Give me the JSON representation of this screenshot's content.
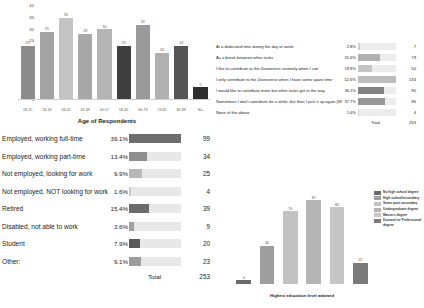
{
  "age_chart": {
    "xtitle": "Age of Respondents",
    "yticks": [
      "40",
      "35",
      "30",
      "25",
      "20",
      "15",
      "10",
      "5",
      "0"
    ]
  },
  "employment": {
    "total_label": "Total",
    "total_value": "253"
  },
  "contrib": {
    "total_label": "Total",
    "total_value": "253"
  },
  "education": {
    "xtitle": "Highest education level attained"
  },
  "chart_data": [
    {
      "type": "bar",
      "title": "Age of Respondents",
      "xlabel": "Age of Respondents",
      "ylabel": "",
      "ylim": [
        0,
        40
      ],
      "grid": false,
      "categories": [
        "18-25",
        "26-33",
        "34-41",
        "42-49",
        "50-57",
        "58-65",
        "66-73",
        "74-81",
        "82-89",
        "90+"
      ],
      "values": [
        23,
        29,
        35,
        28,
        30,
        23,
        32,
        20,
        23,
        5
      ],
      "colors": [
        "#8c8c8c",
        "#a3a3a3",
        "#c4c4c4",
        "#a8a8a8",
        "#b5b5b5",
        "#3f3f3f",
        "#9a9a9a",
        "#b0b0b0",
        "#555555",
        "#2e2e2e"
      ]
    },
    {
      "type": "table",
      "title": "Employment status",
      "columns": [
        "Answer",
        "Percent",
        "Count"
      ],
      "rows": [
        {
          "label": "Employed, working full-time",
          "percent": "39.1%",
          "pct_value": 39.1,
          "count": "99",
          "color": "#6e6e6e"
        },
        {
          "label": "Employed, working part-time",
          "percent": "13.4%",
          "pct_value": 13.4,
          "count": "34",
          "color": "#8f8f8f"
        },
        {
          "label": "Not employed, looking for work",
          "percent": "9.9%",
          "pct_value": 9.9,
          "count": "25",
          "color": "#b8b8b8"
        },
        {
          "label": "Not employed, NOT looking for work",
          "percent": "1.6%",
          "pct_value": 1.6,
          "count": "4",
          "color": "#c9c9c9"
        },
        {
          "label": "Retired",
          "percent": "15.4%",
          "pct_value": 15.4,
          "count": "39",
          "color": "#6b6b6b"
        },
        {
          "label": "Disabled, not able to work",
          "percent": "3.6%",
          "pct_value": 3.6,
          "count": "9",
          "color": "#a0a0a0"
        },
        {
          "label": "Student",
          "percent": "7.9%",
          "pct_value": 7.9,
          "count": "20",
          "color": "#5a5a5a"
        },
        {
          "label": "Other:",
          "percent": "9.1%",
          "pct_value": 9.1,
          "count": "23",
          "color": "#9d9d9d"
        }
      ],
      "total_label": "Total",
      "total_value": "253"
    },
    {
      "type": "table",
      "title": "When do you contribute",
      "columns": [
        "Answer",
        "Percent",
        "Count"
      ],
      "rows": [
        {
          "label": "At a dedicated time during the day or week",
          "percent": "2.8%",
          "pct_value": 2.8,
          "count": "7",
          "color": "#cccccc"
        },
        {
          "label": "As a break between other tasks",
          "percent": "31.6%",
          "pct_value": 31.6,
          "count": "79",
          "color": "#b0b0b0"
        },
        {
          "label": "I like to contribute to the Zooniverse routinely when I can",
          "percent": "19.8%",
          "pct_value": 19.8,
          "count": "50",
          "color": "#c4c4c4"
        },
        {
          "label": "I only contribute to the Zooniverse when I have some spare time",
          "percent": "52.6%",
          "pct_value": 52.6,
          "count": "134",
          "color": "#bdbdbd"
        },
        {
          "label": "I would like to contribute more but other tasks get in the way",
          "percent": "36.1%",
          "pct_value": 36.1,
          "count": "90",
          "color": "#828282"
        },
        {
          "label": "Sometimes I don't contribute for a while, but then I pick it up again (What makes you stop?)",
          "percent": "37.7%",
          "pct_value": 37.7,
          "count": "96",
          "color": "#969696"
        },
        {
          "label": "None of the above",
          "percent": "1.6%",
          "pct_value": 1.6,
          "count": "4",
          "color": "#d2d2d2"
        }
      ],
      "total_label": "Total",
      "total_value": "253"
    },
    {
      "type": "bar",
      "title": "Highest education level attained",
      "xlabel": "Highest education level attained",
      "ylabel": "",
      "ylim": [
        0,
        100
      ],
      "grid": false,
      "categories": [
        "No high school degree",
        "High school/secondary",
        "Some post-secondary",
        "Undergraduate degree",
        "Masters degree",
        "Doctoral or Professional degree"
      ],
      "values": [
        4,
        40,
        76,
        87,
        80,
        22
      ],
      "colors": [
        "#6b6b6b",
        "#9e9e9e",
        "#c2c2c2",
        "#b4b4b4",
        "#c6c6c6",
        "#7a7a7a"
      ],
      "legend_position": "right"
    }
  ]
}
